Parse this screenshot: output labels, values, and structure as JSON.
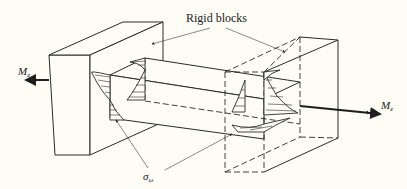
{
  "figure": {
    "labels": {
      "rigid_blocks": "Rigid blocks",
      "moment_left": {
        "symbol": "M",
        "subscript": "z"
      },
      "moment_right": {
        "symbol": "M",
        "subscript": "z"
      },
      "warping_stress": {
        "symbol": "σ",
        "subscript": "ω"
      }
    },
    "components": [
      "left-rigid-block",
      "right-rigid-block-transparent",
      "beam",
      "left-stress-distribution",
      "right-stress-distribution",
      "torque-arrows"
    ]
  }
}
